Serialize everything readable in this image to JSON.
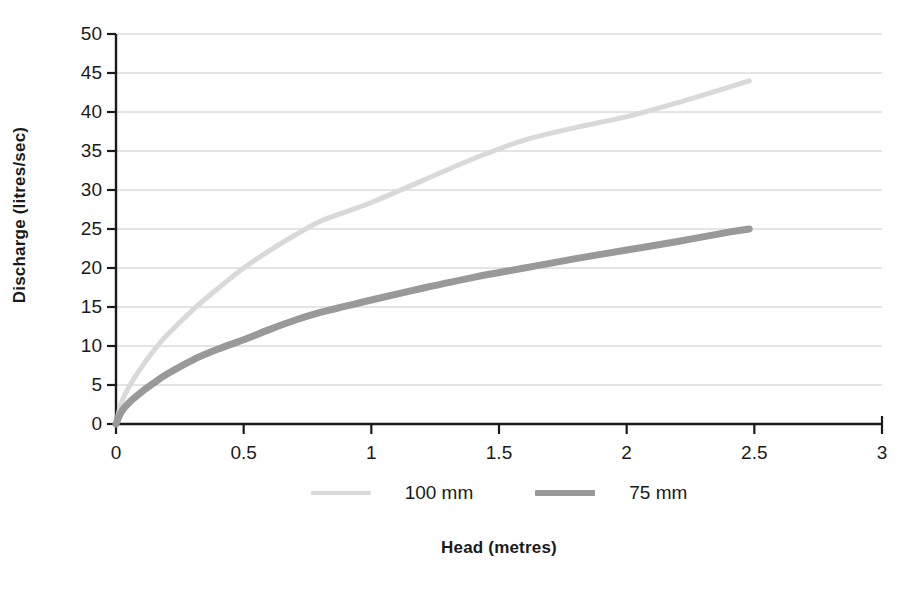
{
  "chart_data": {
    "type": "line",
    "title": "",
    "xlabel": "Head (metres)",
    "ylabel": "Discharge (litres/sec)",
    "xlim": [
      0,
      3
    ],
    "ylim": [
      0,
      50
    ],
    "grid": true,
    "grid_axis": "y",
    "legend_position": "bottom",
    "x_ticks": [
      "0",
      "0.5",
      "1",
      "1.5",
      "2",
      "2.5",
      "3"
    ],
    "x_tick_values": [
      0,
      0.5,
      1,
      1.5,
      2,
      2.5,
      3
    ],
    "y_ticks": [
      "0",
      "5",
      "10",
      "15",
      "20",
      "25",
      "30",
      "35",
      "40",
      "45",
      "50"
    ],
    "y_tick_values": [
      0,
      5,
      10,
      15,
      20,
      25,
      30,
      35,
      40,
      45,
      50
    ],
    "series": [
      {
        "name": "100 mm",
        "color": "#d9d9d9",
        "line_width": 5,
        "x": [
          0,
          0.02,
          0.05,
          0.1,
          0.15,
          0.2,
          0.3,
          0.4,
          0.5,
          0.6,
          0.7,
          0.8,
          0.9,
          1.0,
          1.2,
          1.4,
          1.6,
          1.8,
          2.0,
          2.2,
          2.4,
          2.48
        ],
        "y": [
          0,
          2.6,
          4.7,
          7.3,
          9.5,
          11.4,
          14.6,
          17.4,
          20.0,
          22.2,
          24.2,
          26.0,
          27.2,
          28.4,
          31.2,
          34.0,
          36.4,
          38.0,
          39.4,
          41.2,
          43.2,
          44.0
        ]
      },
      {
        "name": "75 mm",
        "color": "#999999",
        "line_width": 7,
        "x": [
          0,
          0.02,
          0.05,
          0.1,
          0.15,
          0.2,
          0.3,
          0.4,
          0.5,
          0.6,
          0.7,
          0.8,
          0.9,
          1.0,
          1.2,
          1.4,
          1.6,
          1.8,
          2.0,
          2.2,
          2.4,
          2.48
        ],
        "y": [
          0,
          1.5,
          2.7,
          4.1,
          5.3,
          6.4,
          8.2,
          9.6,
          10.8,
          12.1,
          13.3,
          14.3,
          15.1,
          15.9,
          17.4,
          18.8,
          20.0,
          21.2,
          22.3,
          23.4,
          24.6,
          25.0
        ]
      }
    ],
    "series_labels": [
      "100 mm",
      "75 mm"
    ],
    "axis_color": "#1a1a1a",
    "grid_color": "#c8c8d2",
    "background": "#ffffff"
  }
}
